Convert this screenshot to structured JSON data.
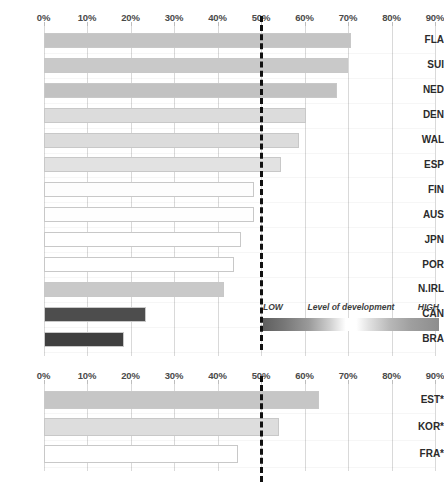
{
  "chart_data": [
    {
      "type": "bar",
      "orientation": "horizontal",
      "id": "top-chart",
      "title": "",
      "xlabel": "",
      "ylabel": "",
      "xlim": [
        0,
        90
      ],
      "xticks": [
        "0%",
        "10%",
        "20%",
        "30%",
        "40%",
        "50%",
        "60%",
        "70%",
        "80%",
        "90%"
      ],
      "xtick_values": [
        0,
        10,
        20,
        30,
        40,
        50,
        60,
        70,
        80,
        90
      ],
      "grid": true,
      "categories": [
        "FLA",
        "SUI",
        "NED",
        "DEN",
        "WAL",
        "ESP",
        "FIN",
        "AUS",
        "JPN",
        "POR",
        "N.IRL",
        "CAN",
        "BRA"
      ],
      "values": [
        70.8,
        70.1,
        67.5,
        60.3,
        58.7,
        54.5,
        48.5,
        48.3,
        45.5,
        43.8,
        41.5,
        23.6,
        18.5
      ],
      "bar_colors": [
        "#c4c4c4",
        "#c9c9c9",
        "#c2c2c2",
        "#dcdcdc",
        "#dcdcdc",
        "#e2e2e2",
        "#fdfdfd",
        "#fefefe",
        "#ffffff",
        "#ffffff",
        "#c9c9c9",
        "#4d4d4d",
        "#3f3f3f"
      ],
      "annotations": [
        {
          "name": "fifty-percent-reference-line",
          "type": "vline",
          "value": 50,
          "style": "dashed",
          "color": "#111111"
        }
      ]
    },
    {
      "type": "bar",
      "orientation": "horizontal",
      "id": "bottom-chart",
      "title": "",
      "xlabel": "",
      "ylabel": "",
      "xlim": [
        0,
        90
      ],
      "xticks": [
        "0%",
        "10%",
        "20%",
        "30%",
        "40%",
        "50%",
        "60%",
        "70%",
        "80%",
        "90%"
      ],
      "xtick_values": [
        0,
        10,
        20,
        30,
        40,
        50,
        60,
        70,
        80,
        90
      ],
      "grid": true,
      "categories": [
        "EST*",
        "KOR*",
        "FRA*"
      ],
      "values": [
        63.4,
        54.1,
        44.8
      ],
      "bar_colors": [
        "#c6c6c6",
        "#dddddd",
        "#ffffff"
      ],
      "annotations": [
        {
          "name": "fifty-percent-reference-line",
          "type": "vline",
          "value": 50,
          "style": "dashed",
          "color": "#111111"
        }
      ]
    }
  ],
  "legend": {
    "low_label": "LOW",
    "mid_label": "Level of development",
    "high_label": "HIGH",
    "gradient_low_color": "#5f5f5f",
    "gradient_mid_color": "#ffffff",
    "gradient_high_color": "#8d8d8d"
  },
  "colors": {
    "gridline": "#d9d9d9",
    "bar_outline": "#c8c8c8",
    "reference_line": "#111111",
    "text": "#2b2b2b",
    "tick_text": "#4a4a4a",
    "background": "#ffffff"
  }
}
